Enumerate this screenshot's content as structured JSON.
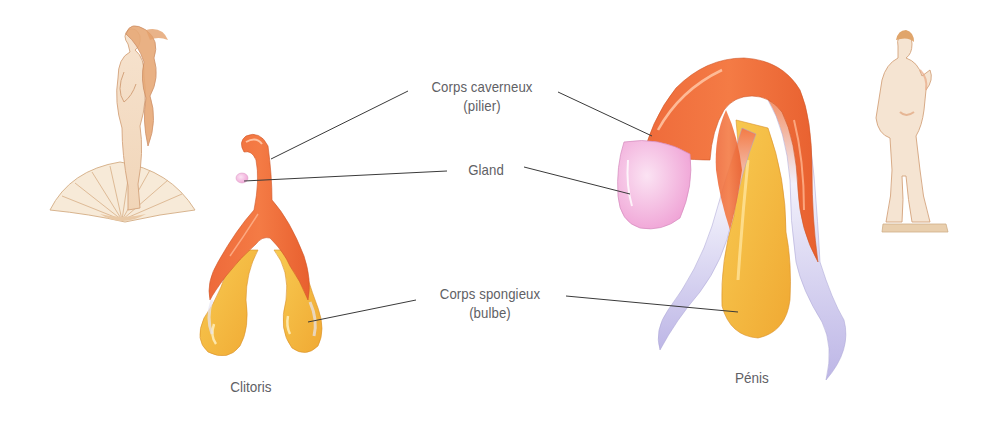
{
  "diagram": {
    "type": "anatomical-comparison",
    "labels": {
      "corps_caverneux": {
        "line1": "Corps caverneux",
        "line2": "(pilier)"
      },
      "gland": {
        "line1": "Gland"
      },
      "corps_spongieux": {
        "line1": "Corps spongieux",
        "line2": "(bulbe)"
      }
    },
    "captions": {
      "left": "Clitoris",
      "right": "Pénis"
    },
    "illustrations": {
      "left_figure": "venus-statue-on-shell",
      "right_figure": "david-statue"
    },
    "colors": {
      "corps_caverneux": "#f0703f",
      "corps_spongieux": "#f5b73a",
      "gland": "#f4b8e0",
      "crura_tips": "#c9c4ea",
      "leader_lines": "#3a3a3a",
      "label_text": "#5f6165",
      "figure_sketch": "#d9a878"
    }
  }
}
